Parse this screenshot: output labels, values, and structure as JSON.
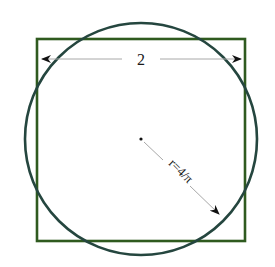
{
  "diagram": {
    "square": {
      "side_label": "2",
      "color": "#2f5a1f"
    },
    "circle": {
      "radius_label": "r=4/π",
      "color": "#25463f"
    },
    "annotation_color": "#9a9a9a"
  }
}
